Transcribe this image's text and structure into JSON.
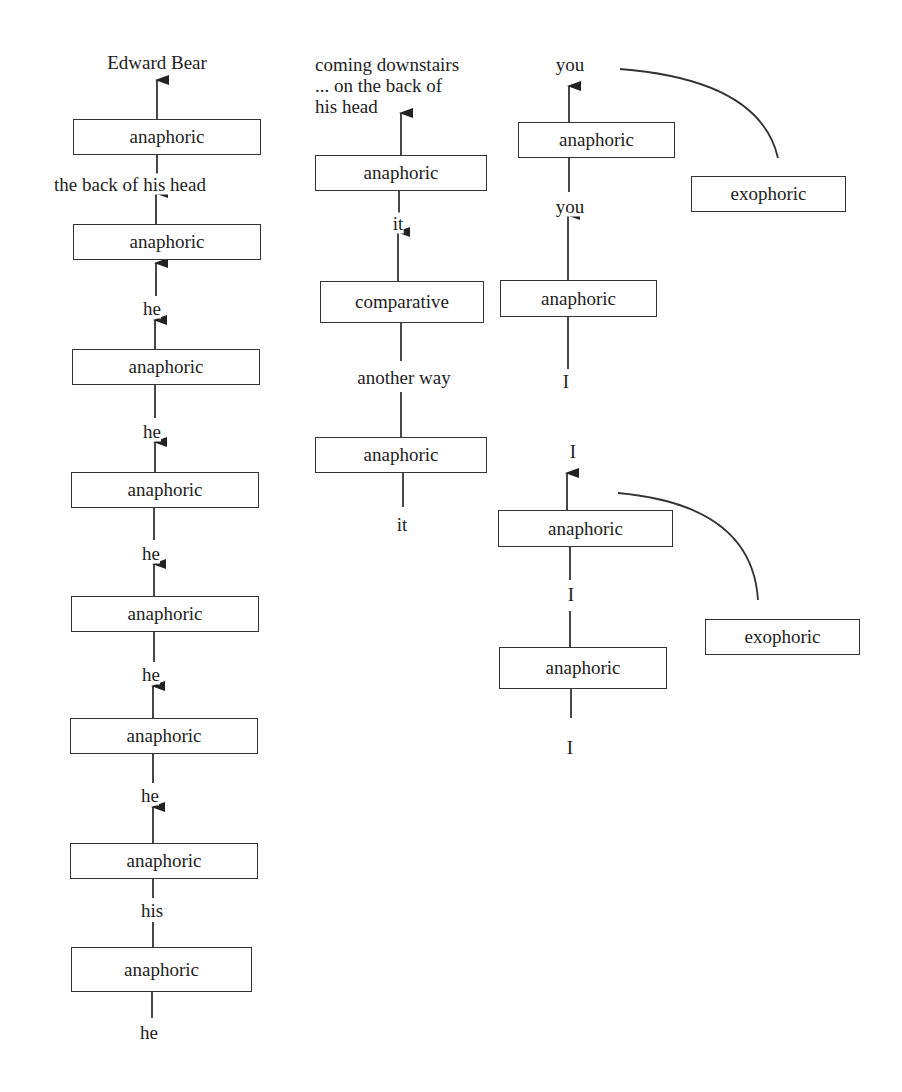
{
  "diagram": {
    "title": "",
    "colors": {
      "line": "#333333",
      "text": "#222222",
      "background": "#ffffff"
    },
    "columns": [
      {
        "id": "left",
        "nodes": [
          {
            "type": "label",
            "text": "Edward Bear",
            "x": 157,
            "y": 62
          },
          {
            "type": "box",
            "text": "anaphoric",
            "x": 73,
            "y": 119,
            "w": 188,
            "h": 36
          },
          {
            "type": "label",
            "text": "the back of his head",
            "x": 130,
            "y": 184
          },
          {
            "type": "box",
            "text": "anaphoric",
            "x": 73,
            "y": 224,
            "w": 188,
            "h": 36
          },
          {
            "type": "label",
            "text": "he",
            "x": 152,
            "y": 308
          },
          {
            "type": "box",
            "text": "anaphoric",
            "x": 72,
            "y": 349,
            "w": 188,
            "h": 36
          },
          {
            "type": "label",
            "text": "he",
            "x": 152,
            "y": 431
          },
          {
            "type": "box",
            "text": "anaphoric",
            "x": 71,
            "y": 472,
            "w": 188,
            "h": 36
          },
          {
            "type": "label",
            "text": "he",
            "x": 151,
            "y": 553
          },
          {
            "type": "box",
            "text": "anaphoric",
            "x": 71,
            "y": 596,
            "w": 188,
            "h": 36
          },
          {
            "type": "label",
            "text": "he",
            "x": 151,
            "y": 674
          },
          {
            "type": "box",
            "text": "anaphoric",
            "x": 70,
            "y": 718,
            "w": 188,
            "h": 36
          },
          {
            "type": "label",
            "text": "he",
            "x": 150,
            "y": 795
          },
          {
            "type": "box",
            "text": "anaphoric",
            "x": 70,
            "y": 843,
            "w": 188,
            "h": 36
          },
          {
            "type": "label",
            "text": "his",
            "x": 152,
            "y": 910
          },
          {
            "type": "box",
            "text": "anaphoric",
            "x": 71,
            "y": 947,
            "w": 181,
            "h": 45
          },
          {
            "type": "label",
            "text": "he",
            "x": 149,
            "y": 1032
          }
        ]
      },
      {
        "id": "middle",
        "nodes": [
          {
            "type": "multiline",
            "text": "coming downstairs\n... on the back of\nhis head",
            "x": 315,
            "y": 53
          },
          {
            "type": "box",
            "text": "anaphoric",
            "x": 315,
            "y": 155,
            "w": 172,
            "h": 36
          },
          {
            "type": "label",
            "text": "it",
            "x": 398,
            "y": 223
          },
          {
            "type": "box",
            "text": "comparative",
            "x": 320,
            "y": 281,
            "w": 164,
            "h": 42
          },
          {
            "type": "label",
            "text": "another way",
            "x": 404,
            "y": 377
          },
          {
            "type": "box",
            "text": "anaphoric",
            "x": 315,
            "y": 437,
            "w": 172,
            "h": 36
          },
          {
            "type": "label",
            "text": "it",
            "x": 402,
            "y": 524
          }
        ]
      },
      {
        "id": "right",
        "nodes": [
          {
            "type": "label",
            "text": "you",
            "x": 570,
            "y": 64
          },
          {
            "type": "box",
            "text": "anaphoric",
            "x": 518,
            "y": 122,
            "w": 157,
            "h": 36
          },
          {
            "type": "label",
            "text": "you",
            "x": 570,
            "y": 206
          },
          {
            "type": "box",
            "text": "exophoric",
            "x": 691,
            "y": 176,
            "w": 155,
            "h": 36
          },
          {
            "type": "box",
            "text": "anaphoric",
            "x": 500,
            "y": 280,
            "w": 157,
            "h": 37
          },
          {
            "type": "label",
            "text": "I",
            "x": 566,
            "y": 381
          },
          {
            "type": "label",
            "text": "I",
            "x": 573,
            "y": 451
          },
          {
            "type": "box",
            "text": "anaphoric",
            "x": 498,
            "y": 510,
            "w": 175,
            "h": 37
          },
          {
            "type": "label",
            "text": "I",
            "x": 571,
            "y": 594
          },
          {
            "type": "box",
            "text": "exophoric",
            "x": 705,
            "y": 619,
            "w": 155,
            "h": 36
          },
          {
            "type": "box",
            "text": "anaphoric",
            "x": 499,
            "y": 647,
            "w": 168,
            "h": 42
          },
          {
            "type": "label",
            "text": "I",
            "x": 570,
            "y": 747
          }
        ]
      }
    ],
    "edges": [
      {
        "from": [
          157,
          119
        ],
        "to": [
          157,
          80
        ],
        "arrow": true
      },
      {
        "from": [
          157,
          154
        ],
        "to": [
          157,
          175
        ],
        "arrow": false
      },
      {
        "from": [
          156,
          224
        ],
        "to": [
          156,
          193
        ],
        "arrow": true
      },
      {
        "from": [
          156,
          296
        ],
        "to": [
          156,
          263
        ],
        "arrow": true
      },
      {
        "from": [
          155,
          349
        ],
        "to": [
          155,
          320
        ],
        "arrow": true
      },
      {
        "from": [
          155,
          384
        ],
        "to": [
          155,
          418
        ],
        "arrow": false
      },
      {
        "from": [
          155,
          472
        ],
        "to": [
          155,
          442
        ],
        "arrow": true
      },
      {
        "from": [
          154,
          507
        ],
        "to": [
          154,
          540
        ],
        "arrow": false
      },
      {
        "from": [
          154,
          596
        ],
        "to": [
          154,
          564
        ],
        "arrow": true
      },
      {
        "from": [
          154,
          632
        ],
        "to": [
          154,
          662
        ],
        "arrow": false
      },
      {
        "from": [
          153,
          718
        ],
        "to": [
          153,
          686
        ],
        "arrow": true
      },
      {
        "from": [
          153,
          754
        ],
        "to": [
          153,
          783
        ],
        "arrow": false
      },
      {
        "from": [
          153,
          843
        ],
        "to": [
          153,
          807
        ],
        "arrow": true
      },
      {
        "from": [
          153,
          879
        ],
        "to": [
          153,
          898
        ],
        "arrow": false
      },
      {
        "from": [
          153,
          922
        ],
        "to": [
          153,
          947
        ],
        "arrow": false
      },
      {
        "from": [
          152,
          992
        ],
        "to": [
          152,
          1018
        ],
        "arrow": false
      },
      {
        "from": [
          401,
          155
        ],
        "to": [
          401,
          113
        ],
        "arrow": true
      },
      {
        "from": [
          399,
          191
        ],
        "to": [
          399,
          213
        ],
        "arrow": false
      },
      {
        "from": [
          398,
          281
        ],
        "to": [
          398,
          232
        ],
        "arrow": true
      },
      {
        "from": [
          401,
          323
        ],
        "to": [
          401,
          361
        ],
        "arrow": false
      },
      {
        "from": [
          401,
          392
        ],
        "to": [
          401,
          437
        ],
        "arrow": false
      },
      {
        "from": [
          403,
          473
        ],
        "to": [
          403,
          507
        ],
        "arrow": false
      },
      {
        "from": [
          569,
          122
        ],
        "to": [
          569,
          86
        ],
        "arrow": true
      },
      {
        "from": [
          569,
          158
        ],
        "to": [
          569,
          192
        ],
        "arrow": false
      },
      {
        "from": [
          568,
          280
        ],
        "to": [
          568,
          215
        ],
        "arrow": true
      },
      {
        "from": [
          568,
          317
        ],
        "to": [
          568,
          369
        ],
        "arrow": false
      },
      {
        "from": [
          567,
          510
        ],
        "to": [
          567,
          473
        ],
        "arrow": true
      },
      {
        "from": [
          570,
          547
        ],
        "to": [
          570,
          580
        ],
        "arrow": false
      },
      {
        "from": [
          570,
          611
        ],
        "to": [
          570,
          647
        ],
        "arrow": false
      },
      {
        "from": [
          571,
          689
        ],
        "to": [
          571,
          718
        ],
        "arrow": false
      }
    ],
    "arcs": [
      {
        "from": [
          620,
          69
        ],
        "ctrl": [
          760,
          80
        ],
        "to": [
          778,
          158
        ]
      },
      {
        "from": [
          618,
          493
        ],
        "ctrl": [
          752,
          505
        ],
        "to": [
          758,
          600
        ]
      }
    ]
  }
}
